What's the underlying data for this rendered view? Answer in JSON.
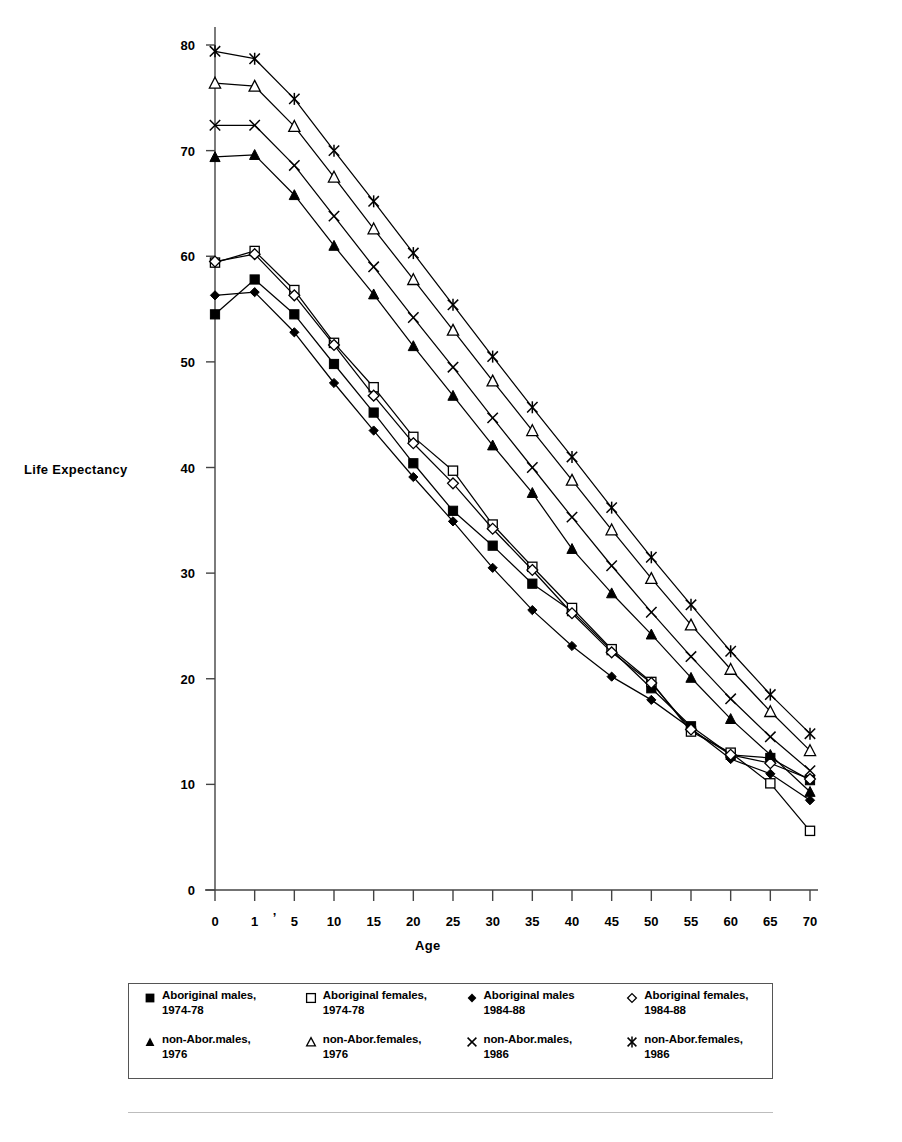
{
  "chart_data": {
    "type": "line",
    "title": "",
    "xlabel": "Age",
    "ylabel": "Life Expectancy",
    "categories": [
      "0",
      "1",
      "5",
      "10",
      "15",
      "20",
      "25",
      "30",
      "35",
      "40",
      "45",
      "50",
      "55",
      "60",
      "65",
      "70"
    ],
    "xtick_labels": [
      "0",
      "1",
      "'",
      "5",
      "10",
      "15",
      "20",
      "25",
      "30",
      "35",
      "40",
      "45",
      "50",
      "55",
      "60",
      "65",
      "70"
    ],
    "ytick_labels": [
      "0",
      "10",
      "20",
      "30",
      "40",
      "50",
      "60",
      "70",
      "80"
    ],
    "ylim": [
      0,
      80
    ],
    "ytick_step": 10,
    "grid": false,
    "legend_position": "bottom",
    "series": [
      {
        "name": "Aboriginal males, 1974-78",
        "marker": "filled-square",
        "values": [
          54.5,
          57.8,
          54.5,
          49.8,
          45.2,
          40.4,
          35.9,
          32.6,
          29.0,
          26.4,
          22.7,
          19.1,
          15.5,
          12.8,
          12.5,
          10.4
        ]
      },
      {
        "name": "Aboriginal females, 1974-78",
        "marker": "open-square",
        "values": [
          59.4,
          60.5,
          56.8,
          51.8,
          47.6,
          42.9,
          39.7,
          34.6,
          30.6,
          26.7,
          22.8,
          19.7,
          15.0,
          13.0,
          10.1,
          5.6
        ]
      },
      {
        "name": "Aboriginal males 1984-88",
        "marker": "filled-diamond",
        "values": [
          56.3,
          56.6,
          52.8,
          48.0,
          43.5,
          39.1,
          34.9,
          30.5,
          26.5,
          23.1,
          20.2,
          18.0,
          15.3,
          12.4,
          11.0,
          8.5
        ]
      },
      {
        "name": "Aboriginal females, 1984-88",
        "marker": "open-diamond",
        "values": [
          59.5,
          60.2,
          56.3,
          51.6,
          46.8,
          42.3,
          38.5,
          34.2,
          30.3,
          26.2,
          22.5,
          19.6,
          15.2,
          12.8,
          12.0,
          10.5
        ]
      },
      {
        "name": "non-Abor.males, 1976",
        "marker": "filled-triangle",
        "values": [
          69.4,
          69.6,
          65.8,
          61.0,
          56.4,
          51.5,
          46.8,
          42.1,
          37.6,
          32.3,
          28.1,
          24.2,
          20.1,
          16.2,
          12.8,
          9.3
        ]
      },
      {
        "name": "non-Abor.females, 1976",
        "marker": "open-triangle",
        "values": [
          76.4,
          76.1,
          72.3,
          67.5,
          62.6,
          57.8,
          53.0,
          48.2,
          43.5,
          38.8,
          34.1,
          29.5,
          25.1,
          20.9,
          16.9,
          13.2
        ]
      },
      {
        "name": "non-Abor.males, 1986",
        "marker": "x-cross",
        "values": [
          72.4,
          72.4,
          68.6,
          63.8,
          59.0,
          54.2,
          49.5,
          44.7,
          40.0,
          35.3,
          30.7,
          26.3,
          22.1,
          18.1,
          14.5,
          11.3
        ]
      },
      {
        "name": "non-Abor.females, 1986",
        "marker": "star-cross",
        "values": [
          79.4,
          78.7,
          74.9,
          70.0,
          65.2,
          60.3,
          55.4,
          50.5,
          45.7,
          41.0,
          36.2,
          31.5,
          27.0,
          22.6,
          18.5,
          14.8
        ]
      }
    ]
  },
  "axes": {
    "y_title": "Life Expectancy",
    "x_title": "Age"
  },
  "legend": {
    "items": [
      {
        "marker": "filled-square",
        "label": "Aboriginal males,\n1974-78"
      },
      {
        "marker": "open-square",
        "label": "Aboriginal females,\n1974-78"
      },
      {
        "marker": "filled-diamond",
        "label": "Aboriginal males\n1984-88"
      },
      {
        "marker": "open-diamond",
        "label": "Aboriginal females,\n1984-88"
      },
      {
        "marker": "filled-triangle",
        "label": "non-Abor.males,\n1976"
      },
      {
        "marker": "open-triangle",
        "label": "non-Abor.females,\n1976"
      },
      {
        "marker": "x-cross",
        "label": "non-Abor.males,\n1986"
      },
      {
        "marker": "star-cross",
        "label": "non-Abor.females,\n1986"
      }
    ]
  },
  "colors": {
    "line": "#000000",
    "axis": "#444444",
    "background": "#ffffff"
  }
}
